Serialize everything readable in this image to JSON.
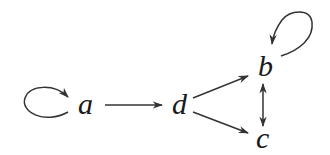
{
  "diagram": {
    "type": "directed-graph",
    "colors": {
      "ink": "#1a1a1a",
      "edge": "#333333",
      "background": "#ffffff"
    },
    "nodes": [
      {
        "id": "a",
        "label": "a"
      },
      {
        "id": "d",
        "label": "d"
      },
      {
        "id": "b",
        "label": "b"
      },
      {
        "id": "c",
        "label": "c"
      }
    ],
    "edges": [
      {
        "from": "a",
        "to": "a",
        "kind": "self-loop"
      },
      {
        "from": "a",
        "to": "d",
        "kind": "directed"
      },
      {
        "from": "d",
        "to": "b",
        "kind": "directed"
      },
      {
        "from": "d",
        "to": "c",
        "kind": "directed"
      },
      {
        "from": "b",
        "to": "b",
        "kind": "self-loop"
      },
      {
        "from": "b",
        "to": "c",
        "kind": "bidirectional"
      }
    ]
  }
}
